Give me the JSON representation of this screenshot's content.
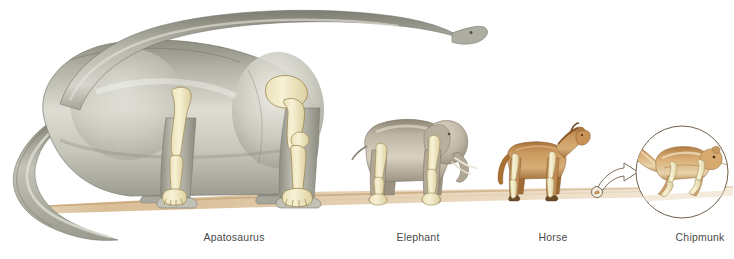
{
  "figure": {
    "kind": "scientific-illustration",
    "background_color": "#ffffff",
    "ground_color": "#e3cba6",
    "bone_color": "#f3ebc6",
    "bone_outline_color": "#a8935f"
  },
  "ground": {
    "name": "ground-line",
    "color_left": "#dcc09a",
    "color_right": "#efe2cd"
  },
  "animals": [
    {
      "id": "apatosaurus",
      "label": "Apatosaurus",
      "label_x": 234,
      "label_y": 233,
      "body_color": "#b9b7aa",
      "shadow_color": "#8d8c82",
      "highlight_color": "#e9e8e0",
      "facing": "right",
      "has_bones": true
    },
    {
      "id": "elephant",
      "label": "Elephant",
      "label_x": 418,
      "label_y": 233,
      "body_color": "#b6ac9b",
      "shadow_color": "#8a8072",
      "highlight_color": "#ded7c9",
      "facing": "right",
      "has_bones": true
    },
    {
      "id": "horse",
      "label": "Horse",
      "label_x": 553,
      "label_y": 233,
      "body_color": "#c08a52",
      "shadow_color": "#8e5f30",
      "highlight_color": "#ddb285",
      "facing": "right",
      "has_bones": true
    },
    {
      "id": "chipmunk",
      "label": "Chipmunk",
      "label_x": 700,
      "label_y": 233,
      "body_color": "#c08a52",
      "shadow_color": "#8a5c2e",
      "highlight_color": "#e4c9a2",
      "facing": "right",
      "has_bones": true,
      "magnified": true,
      "magnifier_circle_color": "#7a6a56",
      "actual_size_marker": true,
      "callout_arrow": true
    }
  ]
}
